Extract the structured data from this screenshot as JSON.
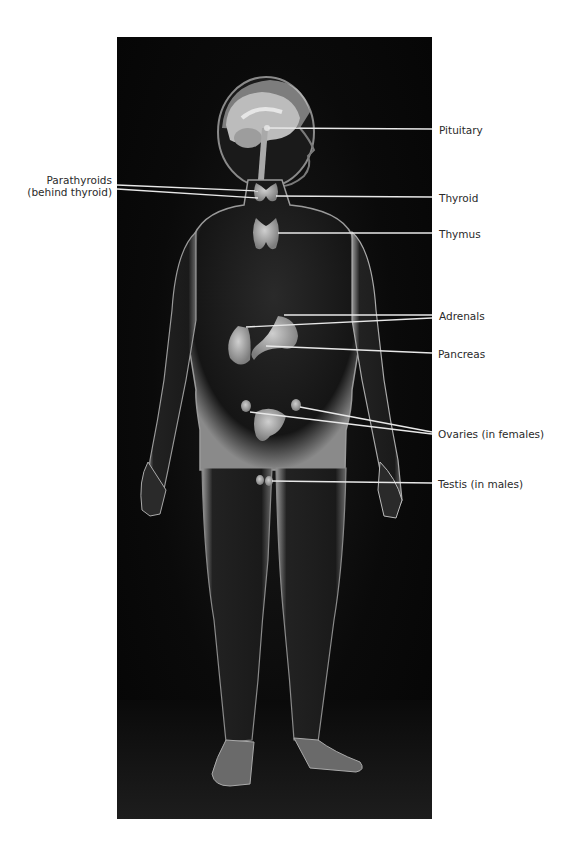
{
  "figure": {
    "background_color": "#000000",
    "line_color": "#e8e8e8"
  },
  "labels": {
    "parathyroids": {
      "line1": "Parathyroids",
      "line2": "(behind thyroid)"
    },
    "pituitary": "Pituitary",
    "thyroid": "Thyroid",
    "thymus": "Thymus",
    "adrenals": "Adrenals",
    "pancreas": "Pancreas",
    "ovaries": "Ovaries (in females)",
    "testis": "Testis (in males)"
  }
}
